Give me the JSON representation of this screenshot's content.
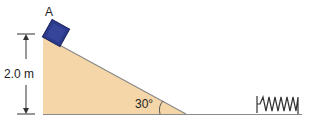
{
  "diagram": {
    "block_label": "A",
    "height_label": "2.0 m",
    "angle_label": "30°",
    "colors": {
      "ramp_fill": "#f5d6a8",
      "ramp_edge": "#8a8a8a",
      "block_fill": "#2c3a8c",
      "block_edge": "#1a2260",
      "ground": "#8a8a8a",
      "spring": "#333333"
    }
  }
}
